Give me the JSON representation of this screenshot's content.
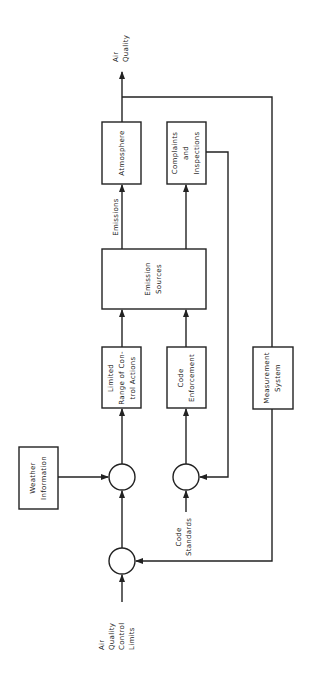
{
  "diagram": {
    "type": "block-diagram",
    "orientation": "rotated-90-ccw",
    "blocks": {
      "atmosphere": {
        "lines": [
          "Atmosphere"
        ]
      },
      "complaints": {
        "lines": [
          "Complaints",
          "and",
          "Inspections"
        ]
      },
      "emission_sources": {
        "lines": [
          "Emission",
          "Sources"
        ]
      },
      "limited_range": {
        "lines": [
          "Limited",
          "Range of Con-",
          "trol Actions"
        ]
      },
      "code_enforcement": {
        "lines": [
          "Code",
          "Enforcement"
        ]
      },
      "measurement": {
        "lines": [
          "Measurement",
          "System"
        ]
      },
      "weather": {
        "lines": [
          "Weather",
          "Information"
        ]
      }
    },
    "labels": {
      "air_quality": [
        "Air",
        "Quality"
      ],
      "emissions": "Emissions",
      "code_standards": [
        "Code",
        "Standards"
      ],
      "aq_control_limits": [
        "Air",
        "Quality",
        "Control",
        "Limits"
      ]
    },
    "summing_junctions": 3,
    "colors": {
      "line": "#222222",
      "background": "#ffffff"
    }
  }
}
